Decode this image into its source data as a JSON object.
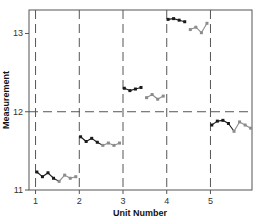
{
  "chart_data": {
    "type": "line",
    "title": "",
    "xlabel": "Unit Number",
    "ylabel": "Measurement",
    "xlim": [
      0.85,
      5.95
    ],
    "ylim": [
      11.0,
      13.3
    ],
    "xticks": [
      1,
      2,
      3,
      4,
      5
    ],
    "xtick_labels": [
      "1",
      "2",
      "3",
      "4",
      "5"
    ],
    "yticks": [
      11,
      12,
      13
    ],
    "ytick_labels": [
      "11",
      "12",
      "13"
    ],
    "reference_lines": {
      "vertical_dashed_at_x": [
        1,
        2,
        3,
        4,
        5
      ],
      "horizontal_dashed_at_y": 12
    },
    "colors": {
      "first_half": "#1a1a1a",
      "second_half": "#8c8c8c",
      "axes": "#555555",
      "dashed": "#555555"
    },
    "series": [
      {
        "name": "Unit 1",
        "unit": 1,
        "values": [
          11.23,
          11.17,
          11.22,
          11.15,
          11.11,
          11.19,
          11.15,
          11.17
        ]
      },
      {
        "name": "Unit 2",
        "unit": 2,
        "values": [
          11.68,
          11.62,
          11.66,
          11.61,
          11.57,
          11.6,
          11.57,
          11.6
        ]
      },
      {
        "name": "Unit 3",
        "unit": 3,
        "values": [
          12.3,
          12.27,
          12.29,
          12.31,
          12.18,
          12.22,
          12.16,
          12.2
        ],
        "gap_after_index": 3
      },
      {
        "name": "Unit 4",
        "unit": 4,
        "values": [
          13.18,
          13.19,
          13.17,
          13.15,
          13.05,
          13.08,
          13.01,
          13.13
        ],
        "gap_after_index": 3
      },
      {
        "name": "Unit 5",
        "unit": 5,
        "values": [
          11.83,
          11.88,
          11.89,
          11.85,
          11.75,
          11.87,
          11.83,
          11.79
        ]
      }
    ],
    "grid": false,
    "legend": "none"
  }
}
